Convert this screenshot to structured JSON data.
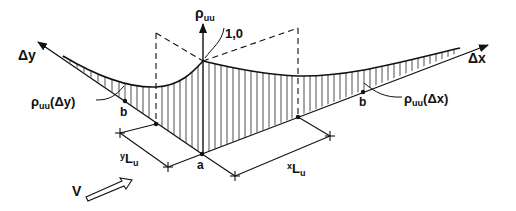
{
  "diagram": {
    "axes": {
      "vertical": {
        "symbol": "ρ",
        "subscript": "uu"
      },
      "x_axis": "Δx",
      "y_axis": "Δy"
    },
    "peak_value": "1,0",
    "curves": {
      "x_curve": {
        "symbol": "ρ",
        "subscript": "uu",
        "arg": "(Δx)"
      },
      "y_curve": {
        "symbol": "ρ",
        "subscript": "uu",
        "arg": "(Δy)"
      }
    },
    "points": {
      "origin": "a",
      "b_x": "b",
      "b_y": "b"
    },
    "dimensions": {
      "x_length": {
        "pre": "x",
        "main": "L",
        "sub": "u"
      },
      "y_length": {
        "pre": "y",
        "main": "L",
        "sub": "u"
      }
    },
    "wind": {
      "label": "V"
    }
  }
}
